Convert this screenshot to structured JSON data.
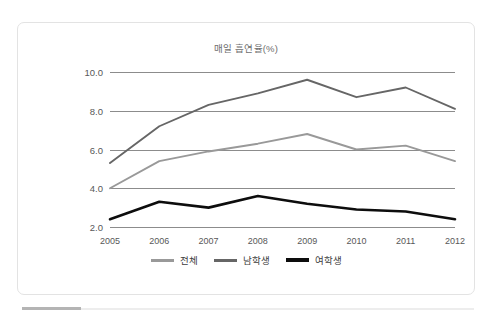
{
  "chart_data": {
    "type": "line",
    "title": "매일 흡연율(%)",
    "xlabel": "",
    "ylabel": "",
    "categories": [
      "2005",
      "2006",
      "2007",
      "2008",
      "2009",
      "2010",
      "2011",
      "2012"
    ],
    "ylim": [
      2.0,
      10.0
    ],
    "yticks": [
      "2.0",
      "4.0",
      "6.0",
      "8.0",
      "10.0"
    ],
    "ytick_values": [
      2.0,
      4.0,
      6.0,
      8.0,
      10.0
    ],
    "grid": true,
    "legend_position": "bottom",
    "series": [
      {
        "name": "전체",
        "color": "#999999",
        "values": [
          4.0,
          5.4,
          5.9,
          6.3,
          6.8,
          6.0,
          6.2,
          5.4
        ]
      },
      {
        "name": "남학생",
        "color": "#666666",
        "values": [
          5.3,
          7.2,
          8.3,
          8.9,
          9.6,
          8.7,
          9.2,
          8.1
        ]
      },
      {
        "name": "여학생",
        "color": "#0d0d0d",
        "values": [
          2.4,
          3.3,
          3.0,
          3.6,
          3.2,
          2.9,
          2.8,
          2.4
        ]
      }
    ]
  },
  "colors": {
    "grid": "#8c8c8c",
    "card_border": "#e3e3e3",
    "title_text": "#6e6e6e",
    "tick_text": "#585858",
    "legend_text": "#3d3d3d",
    "background": "#ffffff"
  }
}
